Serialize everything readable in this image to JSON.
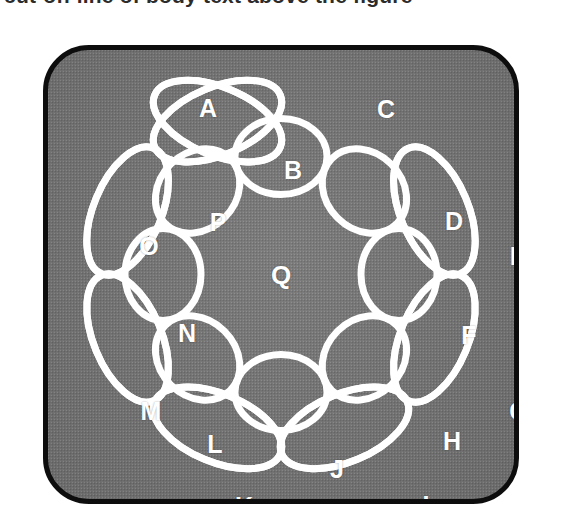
{
  "caption": {
    "text": "cut-off line of body text above the figure"
  },
  "figure": {
    "name": "interlocking-ring-chain",
    "panel": {
      "fill_color": "#7b7b7b",
      "border_color": "#0d0d0d",
      "corner_radius": 46,
      "texture": "halftone-dots"
    },
    "ring_color": "#ffffff",
    "ring_count": 16,
    "center_label": "Q",
    "labels": [
      "A",
      "B",
      "C",
      "D",
      "E",
      "F",
      "G",
      "H",
      "I",
      "J",
      "K",
      "L",
      "M",
      "N",
      "O",
      "P",
      "Q"
    ]
  },
  "chart_data": {
    "type": "diagram",
    "center": {
      "cx": 233,
      "cy": 224.5,
      "label": "Q"
    },
    "ring_color": "#ffffff",
    "stroke_width": 7,
    "rings": [
      {
        "label": "A",
        "kind": "outer",
        "angle_deg": -67.5,
        "radius": 166,
        "rx": 68,
        "ry": 34,
        "cx": 169.5,
        "cy": 71.1,
        "rot_deg": 22.5,
        "label_x": 160,
        "label_y": 58
      },
      {
        "label": "B",
        "kind": "inner",
        "angle_deg": -45.0,
        "radius": 118,
        "rx": 46,
        "ry": 38,
        "cx": 316.4,
        "cy": 141.0,
        "rot_deg": 45.0,
        "label_x": 245,
        "label_y": 120
      },
      {
        "label": "C",
        "kind": "outer",
        "angle_deg": -22.5,
        "radius": 166,
        "rx": 68,
        "ry": 34,
        "cx": 386.4,
        "cy": 161.0,
        "rot_deg": 67.5,
        "label_x": 338,
        "label_y": 59
      },
      {
        "label": "D",
        "kind": "inner",
        "angle_deg": 0.0,
        "radius": 118,
        "rx": 46,
        "ry": 38,
        "cx": 351.0,
        "cy": 224.5,
        "rot_deg": 90.0,
        "label_x": 406,
        "label_y": 171
      },
      {
        "label": "E",
        "kind": "outer",
        "angle_deg": 22.5,
        "radius": 166,
        "rx": 68,
        "ry": 34,
        "cx": 386.4,
        "cy": 288.0,
        "rot_deg": 112.5,
        "label_x": 470,
        "label_y": 206
      },
      {
        "label": "F",
        "kind": "inner",
        "angle_deg": 45.0,
        "radius": 118,
        "rx": 46,
        "ry": 38,
        "cx": 316.4,
        "cy": 308.0,
        "rot_deg": 135.0,
        "label_x": 421,
        "label_y": 285
      },
      {
        "label": "G",
        "kind": "outer",
        "angle_deg": 67.5,
        "radius": 166,
        "rx": 68,
        "ry": 34,
        "cx": 296.5,
        "cy": 377.9,
        "rot_deg": 157.5,
        "label_x": 471,
        "label_y": 361
      },
      {
        "label": "H",
        "kind": "inner",
        "angle_deg": 90.0,
        "radius": 118,
        "rx": 46,
        "ry": 38,
        "cx": 233.0,
        "cy": 342.5,
        "rot_deg": 180.0,
        "label_x": 404,
        "label_y": 391
      },
      {
        "label": "I",
        "kind": "outer",
        "angle_deg": 112.5,
        "radius": 166,
        "rx": 68,
        "ry": 34,
        "cx": 169.5,
        "cy": 377.9,
        "rot_deg": 202.5,
        "label_x": 378,
        "label_y": 455
      },
      {
        "label": "J",
        "kind": "inner",
        "angle_deg": 135.0,
        "radius": 118,
        "rx": 46,
        "ry": 38,
        "cx": 149.6,
        "cy": 308.0,
        "rot_deg": 225.0,
        "label_x": 289,
        "label_y": 419
      },
      {
        "label": "K",
        "kind": "outer",
        "angle_deg": 157.5,
        "radius": 166,
        "rx": 68,
        "ry": 34,
        "cx": 79.6,
        "cy": 288.0,
        "rot_deg": 247.5,
        "label_x": 196,
        "label_y": 456
      },
      {
        "label": "L",
        "kind": "inner",
        "angle_deg": 180.0,
        "radius": 118,
        "rx": 46,
        "ry": 38,
        "cx": 115.0,
        "cy": 224.5,
        "rot_deg": 270.0,
        "label_x": 167,
        "label_y": 394
      },
      {
        "label": "M",
        "kind": "outer",
        "angle_deg": 202.5,
        "radius": 166,
        "rx": 68,
        "ry": 34,
        "cx": 79.6,
        "cy": 161.0,
        "rot_deg": 292.5,
        "label_x": 103,
        "label_y": 361
      },
      {
        "label": "N",
        "kind": "inner",
        "angle_deg": 225.0,
        "radius": 118,
        "rx": 46,
        "ry": 38,
        "cx": 149.6,
        "cy": 141.0,
        "rot_deg": 315.0,
        "label_x": 139,
        "label_y": 283
      },
      {
        "label": "O",
        "kind": "outer",
        "angle_deg": 247.5,
        "radius": 166,
        "rx": 68,
        "ry": 34,
        "cx": 169.5,
        "cy": 71.1,
        "rot_deg": 337.5,
        "label_x": 101,
        "label_y": 196
      },
      {
        "label": "P",
        "kind": "inner",
        "angle_deg": 270.0,
        "radius": 118,
        "rx": 46,
        "ry": 38,
        "cx": 233.0,
        "cy": 106.5,
        "rot_deg": 0.0,
        "label_x": 170,
        "label_y": 172
      }
    ]
  }
}
